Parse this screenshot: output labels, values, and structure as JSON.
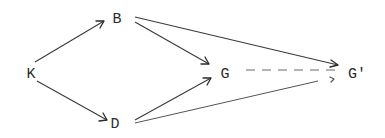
{
  "diagram": {
    "type": "directed-graph",
    "nodes": {
      "K": {
        "label": "K",
        "x": 31,
        "y": 74
      },
      "B": {
        "label": "B",
        "x": 117,
        "y": 19
      },
      "D": {
        "label": "D",
        "x": 115,
        "y": 124
      },
      "G": {
        "label": "G",
        "x": 225,
        "y": 74
      },
      "Gprime": {
        "label": "G'",
        "x": 357,
        "y": 74
      }
    },
    "edges": [
      {
        "from": "K",
        "to": "B",
        "style": "solid",
        "arrow": true
      },
      {
        "from": "K",
        "to": "D",
        "style": "solid",
        "arrow": true
      },
      {
        "from": "B",
        "to": "G",
        "style": "solid",
        "arrow": true
      },
      {
        "from": "B",
        "to": "G'",
        "style": "solid",
        "arrow": true
      },
      {
        "from": "D",
        "to": "G",
        "style": "solid",
        "arrow": true
      },
      {
        "from": "D",
        "to": "G'",
        "style": "solid",
        "arrow": true
      },
      {
        "from": "G",
        "to": "G'",
        "style": "dashed",
        "arrow": true
      }
    ],
    "colors": {
      "line": "#3a3a3a",
      "dashed": "#6a6a6a",
      "text": "#2b2b2b",
      "background": "#ffffff"
    }
  }
}
